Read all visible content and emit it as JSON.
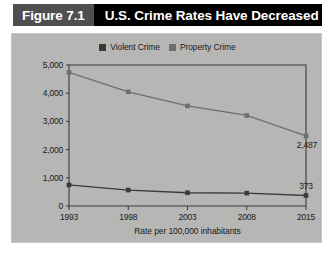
{
  "figure": {
    "tag": "Figure 7.1",
    "title": "U.S. Crime Rates Have Decreased"
  },
  "colors": {
    "panel_bg": "#b6b6b4",
    "header_bg": "#000000",
    "tag_bg": "#4f4f4f",
    "violent": "#3a3a3a",
    "property": "#6e6e6e",
    "axis": "#3b3b3b",
    "text": "#1b1b1b"
  },
  "legend": {
    "position": "top-center",
    "items": [
      {
        "label": "Violent Crime",
        "color": "#3a3a3a"
      },
      {
        "label": "Property Crime",
        "color": "#6e6e6e"
      }
    ]
  },
  "chart_data": {
    "type": "line",
    "title": "U.S. Crime Rates Have Decreased",
    "subtitle": "",
    "xlabel": "Rate per 100,000 inhabitants",
    "ylabel": "",
    "categories": [
      "1993",
      "1998",
      "2003",
      "2008",
      "2015"
    ],
    "x": [
      1993,
      1998,
      2003,
      2008,
      2015
    ],
    "ylim": [
      0,
      5000
    ],
    "yticks": [
      0,
      1000,
      2000,
      3000,
      4000,
      5000
    ],
    "ytick_labels": [
      "0",
      "1,000",
      "2,000",
      "3,000",
      "4,000",
      "5,000"
    ],
    "xtick_labels": [
      "1993",
      "1998",
      "2003",
      "2008",
      "2015"
    ],
    "grid": false,
    "legend_position": "top-center",
    "series": [
      {
        "name": "Violent Crime",
        "color": "#3a3a3a",
        "values": [
          747,
          565,
          470,
          455,
          373
        ],
        "point_labels": [
          "",
          "",
          "",
          "",
          "373"
        ]
      },
      {
        "name": "Property Crime",
        "color": "#6e6e6e",
        "values": [
          4740,
          4050,
          3550,
          3210,
          2487
        ],
        "point_labels": [
          "",
          "",
          "",
          "",
          "2,487"
        ]
      }
    ],
    "annotations": [
      {
        "text": "2,487",
        "series": "Property Crime",
        "x": "2015",
        "y": 2487
      },
      {
        "text": "373",
        "series": "Violent Crime",
        "x": "2015",
        "y": 373
      }
    ]
  }
}
